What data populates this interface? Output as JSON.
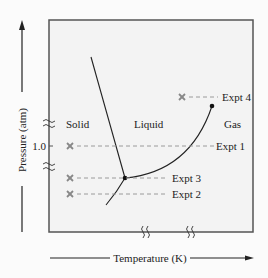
{
  "diagram": {
    "type": "phase-diagram",
    "x_axis_label": "Temperature (K)",
    "y_axis_label": "Pressure (atm)",
    "y_tick_label": "1.0",
    "regions": [
      "Solid",
      "Liquid",
      "Gas"
    ],
    "experiments": [
      {
        "label": "Expt 1",
        "marker": "x-marker"
      },
      {
        "label": "Expt 2",
        "marker": "x-marker"
      },
      {
        "label": "Expt 3",
        "marker": "x-marker"
      },
      {
        "label": "Expt 4",
        "marker": "x-marker"
      }
    ],
    "points": [
      "triple-point",
      "critical-point"
    ],
    "axis_breaks": {
      "y": 2,
      "x": 2
    },
    "colors": {
      "frame": "#555555",
      "curve": "#222222",
      "marker": "#888888",
      "dash": "#9a9a9a",
      "plot_bg": "#f3f3f3"
    }
  }
}
